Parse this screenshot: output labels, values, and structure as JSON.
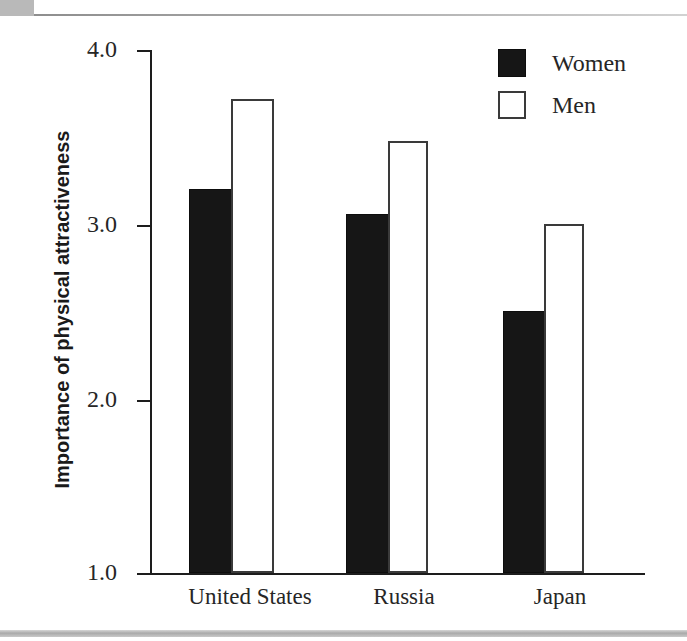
{
  "chart_data": {
    "type": "bar",
    "title": "",
    "xlabel": "",
    "ylabel": "Importance of physical attractiveness",
    "categories": [
      "United States",
      "Russia",
      "Japan"
    ],
    "series": [
      {
        "name": "Women",
        "values": [
          3.2,
          3.06,
          2.5
        ],
        "color": "#161616",
        "fill": "solid"
      },
      {
        "name": "Men",
        "values": [
          3.72,
          3.48,
          3.0
        ],
        "color": "#ffffff",
        "fill": "outline"
      }
    ],
    "ylim": [
      1.0,
      4.0
    ],
    "ytick_labels": [
      "4.0",
      "3.0",
      "2.0",
      "1.0"
    ],
    "ytick_values": [
      4.0,
      3.0,
      2.0,
      1.0
    ],
    "grid": false,
    "legend_position": "top-right"
  },
  "legend": {
    "items": [
      {
        "label": "Women",
        "swatch": "filled-black-square"
      },
      {
        "label": "Men",
        "swatch": "outlined-white-square"
      }
    ]
  },
  "colors": {
    "axis": "#1d1d1d",
    "women_bar": "#161616",
    "men_bar_outline": "#3a3a3a",
    "background": "#ffffff",
    "page_rule": "#b9b9b9"
  }
}
